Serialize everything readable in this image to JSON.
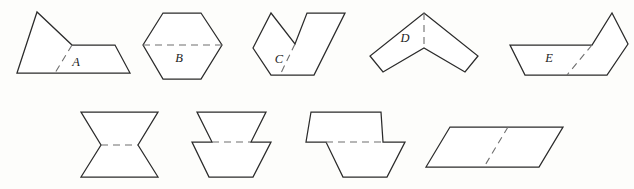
{
  "sheet": {
    "title": "Geometric figures with dashed fold lines",
    "background_color": "#fdfdfb",
    "outline_color": "#2b2b2b",
    "dashed_line_color": "#6e6e6e",
    "label_color": "#1c1c1c",
    "width": 634,
    "height": 189,
    "rows": 2,
    "figure_count": 9
  },
  "figures": [
    {
      "id": "figure-a",
      "label": "A",
      "row": 1,
      "position": 1,
      "description": "triangle joined to a trapezoid forming a pentagon",
      "label_x": 76,
      "label_y": 66,
      "outline": "17,73 37,12 72,45 115,45 130,73",
      "fold": "72,45 55,73"
    },
    {
      "id": "figure-b",
      "label": "B",
      "row": 1,
      "position": 2,
      "description": "hexagon with a horizontal dashed line across the middle",
      "label_x": 179,
      "label_y": 62,
      "outline": "163,13 201,13 222,45 201,79 163,79 143,45",
      "fold": "143,45 222,45"
    },
    {
      "id": "figure-c",
      "label": "C",
      "row": 1,
      "position": 3,
      "description": "concave V or checkmark shaped polygon",
      "label_x": 279,
      "label_y": 63,
      "outline": "253,48 271,13 295,44 307,13 345,13 314,75 271,75 253,48",
      "fold": "295,44 280,75"
    },
    {
      "id": "figure-d",
      "label": "D",
      "row": 1,
      "position": 4,
      "description": "chevron pointing upward with vertical dashed line from apex",
      "label_x": 405,
      "label_y": 42,
      "outline": "424,13 478,56 465,72 424,48 383,72 370,56",
      "fold": "424,13 424,48"
    },
    {
      "id": "figure-e",
      "label": "E",
      "row": 1,
      "position": 5,
      "description": "trapezoid joined to a pentagon flap on the right",
      "label_x": 549,
      "label_y": 62,
      "outline": "510,45 592,45 612,13 628,44 607,75 525,75",
      "fold": "592,45 567,75"
    },
    {
      "id": "figure-f",
      "label": "",
      "row": 2,
      "position": 1,
      "description": "bowtie or hourglass of two triangles meeting at a waist",
      "label_x": 0,
      "label_y": 0,
      "outline": "81,112 158,112 138,145 158,177 81,177 101,145",
      "fold": "101,145 138,145"
    },
    {
      "id": "figure-g",
      "label": "",
      "row": 2,
      "position": 2,
      "description": "two stacked inverted trapezoids meeting at a narrow waist",
      "label_x": 0,
      "label_y": 0,
      "outline": "197,112 266,112 251,142 271,142 253,177 209,177 192,142 212,142",
      "fold": "212,142 251,142"
    },
    {
      "id": "figure-h",
      "label": "",
      "row": 2,
      "position": 3,
      "description": "two trapezoids offset horizontally meeting at a step",
      "label_x": 0,
      "label_y": 0,
      "outline": "311,112 381,112 383,142 405,142 387,177 343,177 326,142 306,142",
      "fold": "326,142 383,142"
    },
    {
      "id": "figure-i",
      "label": "",
      "row": 2,
      "position": 4,
      "description": "parallelogram with a diagonal dashed line",
      "label_x": 0,
      "label_y": 0,
      "outline": "450,127 563,127 539,167 426,167",
      "fold": "508,127 484,167"
    }
  ]
}
